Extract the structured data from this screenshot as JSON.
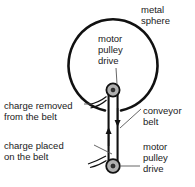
{
  "diagram": {
    "colors": {
      "outline": "#111111",
      "text": "#1a1a1a",
      "pulley_fill": "#b3b3b3",
      "belt_fill": "#ffffff",
      "background": "#ffffff"
    },
    "labels": {
      "metal_sphere": "metal\nsphere",
      "metal_sphere_line1": "metal",
      "metal_sphere_line2": "sphere",
      "motor_pulley_drive_top_line1": "motor",
      "motor_pulley_drive_top_line2": "pulley",
      "motor_pulley_drive_top_line3": "drive",
      "charge_removed_line1": "charge removed",
      "charge_removed_line2": "from the belt",
      "conveyor_belt_line1": "conveyor",
      "conveyor_belt_line2": "belt",
      "charge_placed_line1": "charge placed",
      "charge_placed_line2": "on the belt",
      "motor_pulley_drive_bottom_line1": "motor",
      "motor_pulley_drive_bottom_line2": "pulley",
      "motor_pulley_drive_bottom_line3": "drive"
    },
    "parts": {
      "sphere": "metal sphere",
      "belt": "conveyor belt",
      "top_pulley": "top motor pulley drive",
      "bottom_pulley": "bottom motor pulley drive",
      "belt_arrow_down": "belt direction down (right side)",
      "belt_arrow_up": "belt direction up (left side)"
    }
  }
}
